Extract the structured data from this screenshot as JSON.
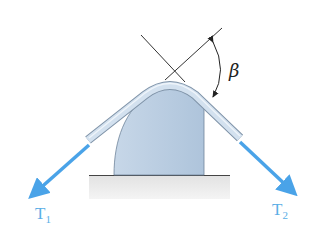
{
  "diagram": {
    "type": "belt-friction-over-post",
    "labels": {
      "tension_left": {
        "main": "T",
        "sub": "1"
      },
      "tension_right": {
        "main": "T",
        "sub": "2"
      },
      "angle": "β"
    },
    "colors": {
      "arrow": "#4aa3e8",
      "belt_fill": "#c9d9ea",
      "belt_edge": "#7f93a8",
      "post_fill": "#b9cde2",
      "ground_fill": "#d9d9d9",
      "line": "#333333"
    }
  }
}
